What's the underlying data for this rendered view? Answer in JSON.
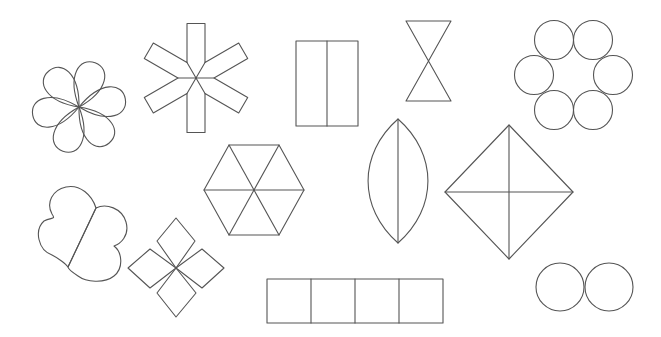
{
  "canvas": {
    "width": 661,
    "height": 337,
    "background": "#ffffff"
  },
  "style": {
    "stroke": "#555555",
    "stroke_width": 1.1
  },
  "shapes": {
    "flower": {
      "center": [
        79,
        107
      ],
      "petal_length": 47,
      "petal_width": 30,
      "angles_deg": [
        -10,
        50,
        110,
        170,
        230,
        290
      ]
    },
    "asterisk": {
      "center": [
        196,
        78
      ],
      "half_length": 54.5,
      "half_width": 9,
      "arm_angles_deg": [
        -90,
        -30,
        30,
        90,
        150,
        210
      ]
    },
    "split_rectangle": {
      "x": 296,
      "y": 41,
      "width": 62,
      "height": 85,
      "divider_x": 327
    },
    "hourglass": {
      "top_y": 21,
      "bottom_y": 101,
      "left_x": 406,
      "right_x": 451
    },
    "circle_ring": {
      "radius": 19.5,
      "centers": [
        [
          554,
          40
        ],
        [
          593,
          40
        ],
        [
          534,
          75
        ],
        [
          613,
          75
        ],
        [
          554,
          110
        ],
        [
          593,
          110
        ]
      ]
    },
    "hexagon": {
      "center": [
        254,
        190
      ],
      "vertices": [
        [
          229,
          145
        ],
        [
          279,
          145
        ],
        [
          304,
          190
        ],
        [
          279,
          235
        ],
        [
          229,
          235
        ],
        [
          204,
          190
        ]
      ]
    },
    "lens": {
      "top": [
        398,
        119
      ],
      "bottom": [
        398,
        243
      ],
      "half_width": 30
    },
    "diamond": {
      "top": [
        509,
        125
      ],
      "right": [
        573,
        192
      ],
      "bottom": [
        509,
        259
      ],
      "left": [
        445,
        192
      ]
    },
    "butterfly": {
      "divider": [
        [
          96,
          208
        ],
        [
          68,
          267
        ]
      ],
      "outline": "M96,208 C92,195 80,184 66,187 C52,190 46,203 52,214 C56,220 52,217 44,221 C34,230 38,250 52,255 C58,258 66,264 68,267 Z M96,208 C106,203 122,208 126,222 C130,236 120,244 114,246 C122,252 124,268 114,276 C104,284 86,282 78,276 C72,272 68,268 68,267 Z"
    },
    "diamond_cross": {
      "center": [
        176,
        268
      ],
      "petals": [
        [
          [
            176,
            268
          ],
          [
            157,
            241
          ],
          [
            176,
            218
          ],
          [
            195,
            241
          ]
        ],
        [
          [
            176,
            268
          ],
          [
            202,
            249
          ],
          [
            224,
            268
          ],
          [
            202,
            288
          ]
        ],
        [
          [
            176,
            268
          ],
          [
            196,
            293
          ],
          [
            176,
            317
          ],
          [
            157,
            293
          ]
        ],
        [
          [
            176,
            268
          ],
          [
            150,
            288
          ],
          [
            128,
            268
          ],
          [
            150,
            249
          ]
        ]
      ]
    },
    "square_strip": {
      "x": 267,
      "y": 279,
      "cell": 44,
      "count": 4
    },
    "twin_circles": {
      "radius": 24,
      "centers": [
        [
          560,
          287
        ],
        [
          609,
          287
        ]
      ]
    }
  }
}
